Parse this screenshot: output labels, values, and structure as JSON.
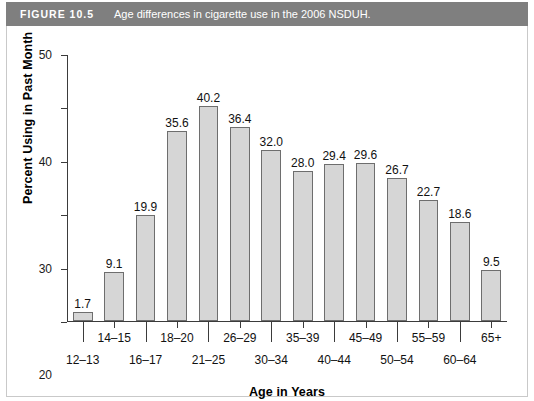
{
  "figure": {
    "number_label": "FIGURE 10.5",
    "caption": "Age differences in cigarette use in the 2006 NSDUH.",
    "header_bg": "#7f7f7f",
    "header_text_color": "#ffffff"
  },
  "chart_data": {
    "type": "bar",
    "title": "Age differences in cigarette use in the 2006 NSDUH.",
    "xlabel": "Age in Years",
    "ylabel": "Percent Using in Past Month",
    "categories": [
      "12–13",
      "14–15",
      "16–17",
      "18–20",
      "21–25",
      "26–29",
      "30–34",
      "35–39",
      "40–44",
      "45–49",
      "50–54",
      "55–59",
      "60–64",
      "65+"
    ],
    "values": [
      1.7,
      9.1,
      19.9,
      35.6,
      40.2,
      36.4,
      32.0,
      28.0,
      29.4,
      29.6,
      26.7,
      22.7,
      18.6,
      9.5
    ],
    "value_labels": [
      "1.7",
      "9.1",
      "19.9",
      "35.6",
      "40.2",
      "36.4",
      "32.0",
      "28.0",
      "29.4",
      "29.6",
      "26.7",
      "22.7",
      "18.6",
      "9.5"
    ],
    "ylim": [
      0,
      50
    ],
    "yticks": [
      0,
      10,
      20,
      30,
      40,
      50
    ],
    "ytick_labels": [
      "0",
      "10",
      "20",
      "30",
      "40",
      "50"
    ],
    "grid": false,
    "legend": false,
    "bar_fill_color": "#d6d6d6",
    "bar_border_color": "#6e6e6e",
    "axis_color": "#3b3b3b"
  }
}
